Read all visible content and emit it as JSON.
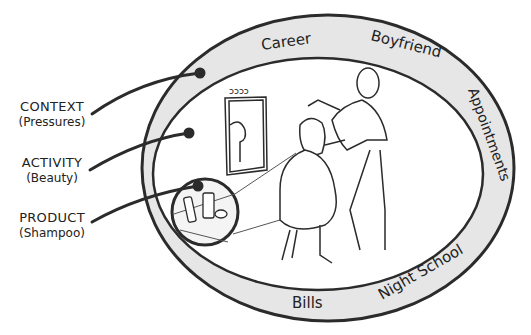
{
  "labels": [
    {
      "title": "CONTEXT",
      "subtitle": "(Pressures)"
    },
    {
      "title": "ACTIVITY",
      "subtitle": "(Beauty)"
    },
    {
      "title": "PRODUCT",
      "subtitle": "(Shampoo)"
    }
  ],
  "context_ring": {
    "words": [
      "Career",
      "Boyfriend",
      "Appointments",
      "Night School",
      "Bills"
    ]
  },
  "colors": {
    "ring_fill": "#e6e6e6",
    "stroke": "#2b2b2b",
    "background": "#ffffff"
  }
}
